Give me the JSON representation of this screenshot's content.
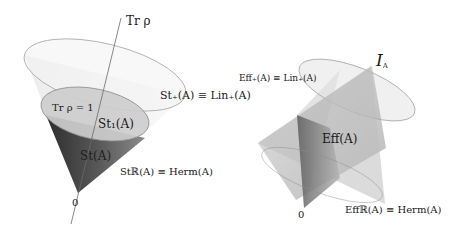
{
  "figure": {
    "left_panel": {
      "title": "State cone",
      "axis_label": "Tr ρ",
      "normalization_label": "Tr ρ = 1",
      "normalized_states_label": "St₁(A)",
      "positive_cone_label": "St₊(A) ≡ Lin₊(A)",
      "state_cone_label": "St(A)",
      "real_span_label": "Stℝ(A) ≡ Herm(A)",
      "origin_label": "0"
    },
    "right_panel": {
      "title": "Effect cone",
      "identity_label_main": "I",
      "identity_label_sub": "A",
      "positive_cone_label": "Eff₊(A) ≡ Lin₊(A)",
      "effects_label": "Eff(A)",
      "real_span_label": "Effℝ(A) ≡ Herm(A)",
      "origin_label": "0"
    },
    "colors": {
      "cone_light": "#e8e8e8",
      "cone_mid": "#bdbdbd",
      "cone_dark": "#4a4a4a",
      "outline": "#9a9a9a",
      "axis": "#666666",
      "text": "#1a1a1a"
    }
  }
}
